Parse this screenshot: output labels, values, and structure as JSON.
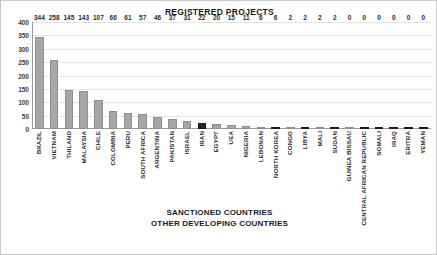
{
  "chart_data": {
    "type": "bar",
    "title": "REGISTERED PROJECTS",
    "subtitle": "",
    "xlabel": "",
    "ylabel": "",
    "ylim": [
      0,
      400
    ],
    "yticks": [
      400,
      350,
      300,
      250,
      200,
      150,
      100,
      50,
      0
    ],
    "grid": true,
    "legend_position": "bottom",
    "legend": [
      {
        "label": "SANCTIONED COUNTRIES",
        "color": "#262626"
      },
      {
        "label": "OTHER DEVELOPING COUNTRIES",
        "color": "#a6a6a6"
      }
    ],
    "categories": [
      "BRAZIL",
      "VIETNAM",
      "THILAND",
      "MALAYSIA",
      "CHILE",
      "COLOMBIA",
      "PERU",
      "SOUTH AFRICA",
      "ARGENTINA",
      "PAKISTAN",
      "ISRAEL",
      "IRAN",
      "EGYPT",
      "UEA",
      "NIGERIA",
      "LEBONAN",
      "NORTH KOREA",
      "CONGO",
      "LIBYA",
      "MALI",
      "SUDAN",
      "GUINEA BISSAU",
      "CENTRAL AFRICAN REPUBLIC",
      "SOMALI",
      "IRAQ",
      "ERITRA",
      "YEMAN"
    ],
    "values": [
      344,
      258,
      145,
      143,
      107,
      66,
      61,
      57,
      46,
      37,
      31,
      22,
      20,
      15,
      11,
      6,
      6,
      2,
      2,
      2,
      2,
      0,
      0,
      0,
      0,
      0,
      0
    ],
    "sanctioned_flags": [
      false,
      false,
      false,
      false,
      false,
      false,
      false,
      false,
      false,
      false,
      false,
      true,
      false,
      false,
      false,
      false,
      true,
      false,
      true,
      false,
      true,
      false,
      true,
      true,
      true,
      true,
      true
    ],
    "colors": {
      "bar_default": "#a6a6a6",
      "bar_sanctioned": "#262626",
      "grid": "#e4e4e4",
      "axis": "#9a9a9a",
      "text": "#2b2b2b",
      "frame": "#c9c9c9"
    }
  }
}
